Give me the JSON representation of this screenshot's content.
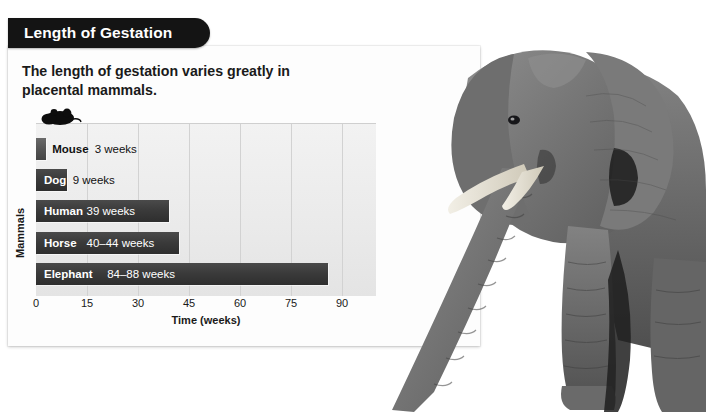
{
  "banner": {
    "title": "Length of Gestation"
  },
  "subtitle": "The length of gestation varies greatly in placental mammals.",
  "icons": {
    "mouse": "mouse-silhouette-icon",
    "elephant": "elephant-photo"
  },
  "colors": {
    "banner_bg": "#141414",
    "card_bg": "#fdfdfd",
    "plot_bg": "#ecebeb",
    "bar_fill": "#3a3a3a",
    "gridline": "#d2d2d2",
    "text": "#1a1a1a"
  },
  "chart_data": {
    "type": "bar",
    "orientation": "horizontal",
    "title": "Length of Gestation",
    "xlabel": "Time (weeks)",
    "ylabel": "Mammals",
    "xlim": [
      0,
      100
    ],
    "xticks": [
      0,
      15,
      30,
      45,
      60,
      75,
      90
    ],
    "grid": true,
    "legend": "none",
    "categories": [
      "Mouse",
      "Dog",
      "Human",
      "Horse",
      "Elephant"
    ],
    "values": [
      3,
      9,
      39,
      42,
      86
    ],
    "value_labels": [
      "3 weeks",
      "9 weeks",
      "39 weeks",
      "40–44 weeks",
      "84–88 weeks"
    ],
    "bars": [
      {
        "label": "Mouse",
        "value": 3,
        "low": 3,
        "high": 3,
        "value_label": "3 weeks",
        "label_inside": false,
        "value_inside": false
      },
      {
        "label": "Dog",
        "value": 9,
        "low": 9,
        "high": 9,
        "value_label": "9 weeks",
        "label_inside": true,
        "value_inside": false
      },
      {
        "label": "Human",
        "value": 39,
        "low": 39,
        "high": 39,
        "value_label": "39 weeks",
        "label_inside": true,
        "value_inside": true
      },
      {
        "label": "Horse",
        "value": 42,
        "low": 40,
        "high": 44,
        "value_label": "40–44 weeks",
        "label_inside": true,
        "value_inside": true
      },
      {
        "label": "Elephant",
        "value": 86,
        "low": 84,
        "high": 88,
        "value_label": "84–88 weeks",
        "label_inside": true,
        "value_inside": true
      }
    ]
  }
}
